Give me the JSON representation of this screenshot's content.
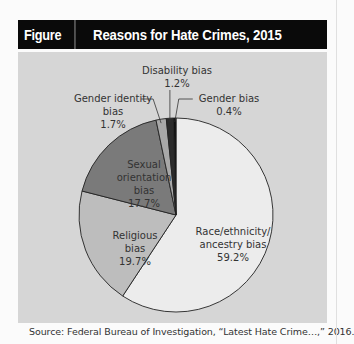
{
  "header": {
    "figure_number": "Figure 7.2",
    "title": "Reasons for Hate Crimes, 2015"
  },
  "source": "Source: Federal Bureau of Investigation, “Latest Hate Crime…,” 2016.",
  "labels": {
    "race": {
      "line1": "Race/ethnicity/",
      "line2": "ancestry bias",
      "pct": "59.2%"
    },
    "religious": {
      "line1": "Religious",
      "line2": "bias",
      "pct": "19.7%"
    },
    "sexual": {
      "line1": "Sexual",
      "line2": "orientation",
      "line3": "bias",
      "pct": "17.7%"
    },
    "gender_identity": {
      "line1": "Gender identity",
      "line2": "bias",
      "pct": "1.7%"
    },
    "disability": {
      "line1": "Disability bias",
      "pct": "1.2%"
    },
    "gender": {
      "line1": "Gender bias",
      "pct": "0.4%"
    }
  },
  "chart_data": {
    "type": "pie",
    "title": "Reasons for Hate Crimes, 2015",
    "figure": "Figure 7.2",
    "start_angle": "12 o'clock, clockwise",
    "categories": [
      "Race/ethnicity/ancestry bias",
      "Religious bias",
      "Sexual orientation bias",
      "Gender identity bias",
      "Disability bias",
      "Gender bias"
    ],
    "values": [
      59.2,
      19.7,
      17.7,
      1.7,
      1.2,
      0.4
    ],
    "colors": [
      "#ececec",
      "#bdbdbd",
      "#7a7a7a",
      "#a8a8a8",
      "#2b2b2b",
      "#0d0d0d"
    ],
    "units": "%",
    "legend": "none (direct labels)",
    "source": "Federal Bureau of Investigation, “Latest Hate Crime…,” 2016."
  }
}
